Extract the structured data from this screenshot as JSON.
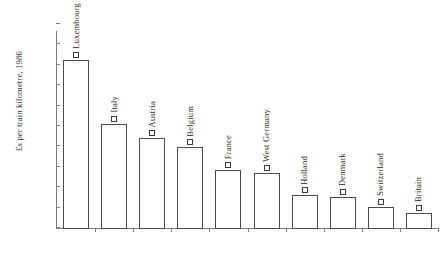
{
  "chart_data": {
    "type": "bar",
    "title": "",
    "xlabel": "",
    "ylabel": "£s per train kilometre, 1986",
    "ylim": [
      0,
      20
    ],
    "ytick_step": 2,
    "yticks": [
      20,
      18,
      16,
      14,
      12,
      10,
      8,
      6,
      4,
      2,
      0
    ],
    "grid": false,
    "legend": "none",
    "marker_style": "open-square",
    "categories": [
      "Luxembourg",
      "Italy",
      "Austria",
      "Belgium",
      "France",
      "West Germany",
      "Holland",
      "Denmark",
      "Switzerland",
      "Britain"
    ],
    "values": [
      16.6,
      10.3,
      8.9,
      8.0,
      5.8,
      5.5,
      3.3,
      3.1,
      2.2,
      1.6
    ],
    "colors": {
      "bar_fill": "#ffffff",
      "bar_stroke": "#4a4a4a",
      "axis": "#7a7a7a",
      "text": "#1f1f1f",
      "background": "#ffffff"
    }
  }
}
